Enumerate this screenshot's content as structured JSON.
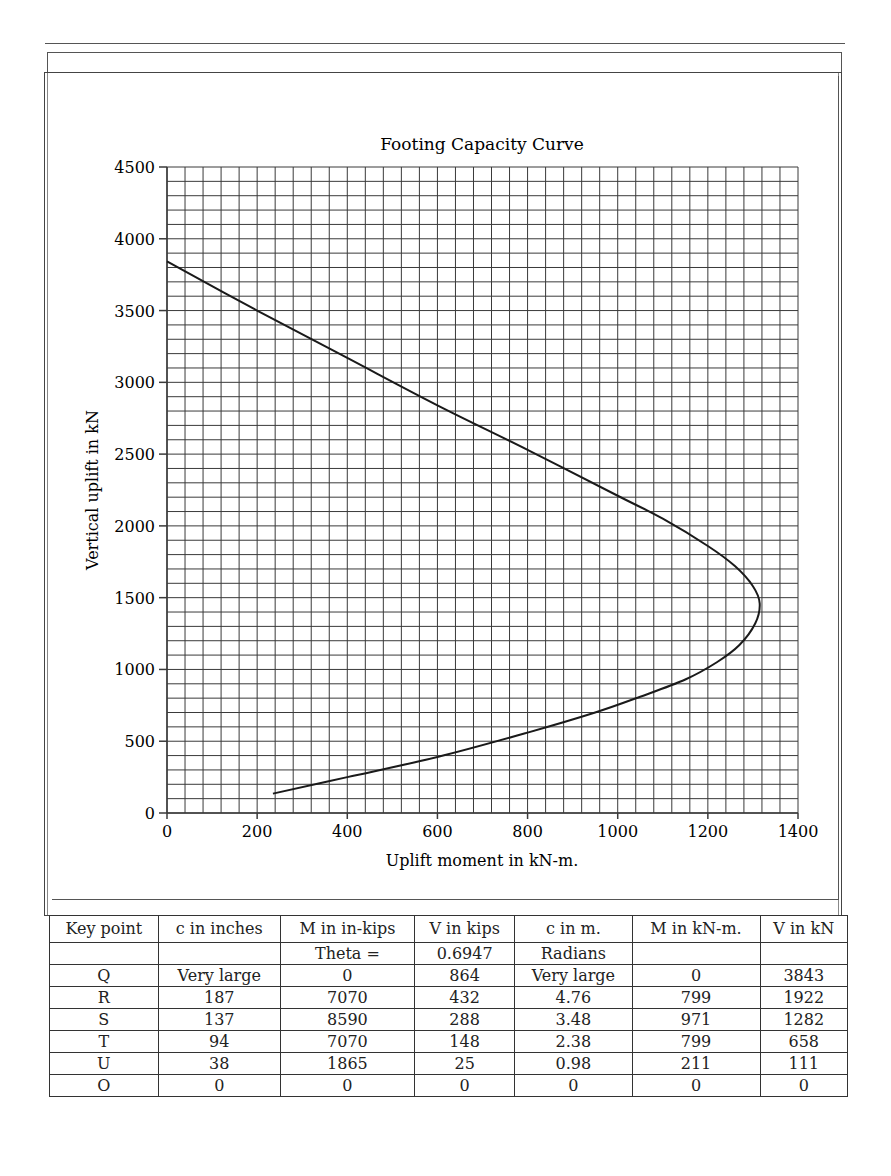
{
  "chart_data": {
    "type": "line",
    "title": "Footing Capacity Curve",
    "xlabel": "Uplift moment in kN-m.",
    "ylabel": "Vertical uplift in kN",
    "xlim": [
      0,
      1400
    ],
    "ylim": [
      0,
      4500
    ],
    "x_ticks": [
      0,
      200,
      400,
      600,
      800,
      1000,
      1200,
      1400
    ],
    "y_ticks": [
      0,
      500,
      1000,
      1500,
      2000,
      2500,
      3000,
      3500,
      4000,
      4500
    ],
    "grid": true,
    "grid_minor_x_step": 40,
    "grid_minor_y_step": 100,
    "legend": null,
    "series": [
      {
        "name": "Capacity curve",
        "points": [
          [
            0,
            3843
          ],
          [
            200,
            3500
          ],
          [
            400,
            3170
          ],
          [
            600,
            2840
          ],
          [
            800,
            2530
          ],
          [
            1000,
            2210
          ],
          [
            1100,
            2050
          ],
          [
            1200,
            1860
          ],
          [
            1260,
            1720
          ],
          [
            1300,
            1580
          ],
          [
            1315,
            1460
          ],
          [
            1305,
            1320
          ],
          [
            1270,
            1170
          ],
          [
            1220,
            1050
          ],
          [
            1150,
            930
          ],
          [
            1050,
            810
          ],
          [
            950,
            700
          ],
          [
            800,
            560
          ],
          [
            600,
            390
          ],
          [
            400,
            250
          ],
          [
            235,
            135
          ]
        ]
      }
    ],
    "key_points_kN": [
      {
        "label": "Q",
        "x": 0,
        "y": 3843
      },
      {
        "label": "R",
        "x": 799,
        "y": 1922
      },
      {
        "label": "S",
        "x": 971,
        "y": 1282
      },
      {
        "label": "T",
        "x": 799,
        "y": 658
      },
      {
        "label": "U",
        "x": 211,
        "y": 111
      },
      {
        "label": "O",
        "x": 0,
        "y": 0
      }
    ]
  },
  "table": {
    "headers": [
      "Key point",
      "c in inches",
      "M in in-kips",
      "V in kips",
      "c in m.",
      "M in kN-m.",
      "V in kN"
    ],
    "rows": [
      [
        "",
        "",
        "Theta =",
        "0.6947",
        "Radians",
        "",
        ""
      ],
      [
        "Q",
        "Very large",
        "0",
        "864",
        "Very large",
        "0",
        "3843"
      ],
      [
        "R",
        "187",
        "7070",
        "432",
        "4.76",
        "799",
        "1922"
      ],
      [
        "S",
        "137",
        "8590",
        "288",
        "3.48",
        "971",
        "1282"
      ],
      [
        "T",
        "94",
        "7070",
        "148",
        "2.38",
        "799",
        "658"
      ],
      [
        "U",
        "38",
        "1865",
        "25",
        "0.98",
        "211",
        "111"
      ],
      [
        "O",
        "0",
        "0",
        "0",
        "0",
        "0",
        "0"
      ]
    ]
  },
  "colors": {
    "grid": "#3a3a3a",
    "curve": "#1a1a1a",
    "text": "#222222"
  }
}
